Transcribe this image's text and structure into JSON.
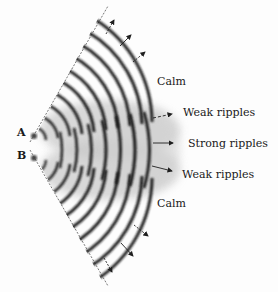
{
  "diagram": {
    "sources": [
      {
        "id": "A",
        "label": "A"
      },
      {
        "id": "B",
        "label": "B"
      }
    ],
    "zones": [
      {
        "id": "calm-top",
        "label": "Calm"
      },
      {
        "id": "weak-top",
        "label": "Weak ripples"
      },
      {
        "id": "strong",
        "label": "Strong ripples"
      },
      {
        "id": "weak-bottom",
        "label": "Weak ripples"
      },
      {
        "id": "calm-bottom",
        "label": "Calm"
      }
    ],
    "colors": {
      "wave": "#1e1e1e",
      "blur": "#b8b8b8",
      "text": "#1a1a1a",
      "background": "#fdfdfd"
    }
  }
}
